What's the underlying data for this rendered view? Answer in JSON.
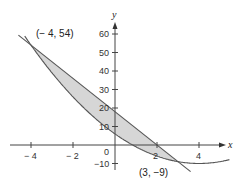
{
  "chart_data": {
    "type": "area",
    "title": "",
    "xlabel": "x",
    "ylabel": "y",
    "xlim": [
      -5,
      5.3
    ],
    "ylim": [
      -12,
      68
    ],
    "grid": false,
    "x_ticks": [
      -4,
      -2,
      2,
      4
    ],
    "x_tick_labels": [
      "− 4",
      "− 2",
      "2",
      "4"
    ],
    "y_ticks": [
      -10,
      10,
      20,
      30,
      40,
      50,
      60
    ],
    "y_tick_labels": [
      "−10",
      "10",
      "20",
      "30",
      "40",
      "50",
      "60"
    ],
    "origin_label": "0",
    "series": [
      {
        "name": "line",
        "equation": "y = -9x + 18",
        "x": [
          -4.6,
          3.6
        ],
        "y": [
          59.4,
          -14.4
        ]
      },
      {
        "name": "parabola",
        "equation": "y = x^2 - 8x + 6",
        "x_range": [
          -4.3,
          5.4
        ]
      }
    ],
    "shaded_region": {
      "between": [
        "line",
        "parabola"
      ],
      "x_from": -4,
      "x_to": 3,
      "color": "#d4d4d4"
    },
    "annotations": [
      {
        "text": "(− 4, 54)",
        "x": -4,
        "y": 54
      },
      {
        "text": "(3, −9)",
        "x": 3,
        "y": -9
      }
    ]
  },
  "labels": {
    "x_axis": "x",
    "y_axis": "y",
    "origin": "0",
    "point1": "(− 4, 54)",
    "point2": "(3, −9)",
    "xt_m4": "− 4",
    "xt_m2": "− 2",
    "xt_2": "2",
    "xt_4": "4",
    "yt_60": "60",
    "yt_50": "50",
    "yt_40": "40",
    "yt_30": "30",
    "yt_20": "20",
    "yt_10": "10",
    "yt_m10": "−10"
  }
}
